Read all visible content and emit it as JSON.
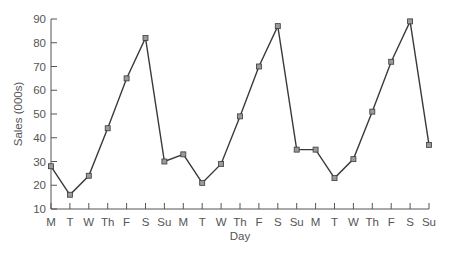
{
  "chart_data": {
    "type": "line",
    "title": "",
    "xlabel": "Day",
    "ylabel": "Sales (000s)",
    "ylim": [
      10,
      90
    ],
    "yticks": [
      10,
      20,
      30,
      40,
      50,
      60,
      70,
      80,
      90
    ],
    "grid": false,
    "legend": null,
    "categories": [
      "M",
      "T",
      "W",
      "Th",
      "F",
      "S",
      "Su",
      "M",
      "T",
      "W",
      "Th",
      "F",
      "S",
      "Su",
      "M",
      "T",
      "W",
      "Th",
      "F",
      "S",
      "Su"
    ],
    "series": [
      {
        "name": "Sales",
        "marker": "square",
        "values": [
          28,
          16,
          24,
          44,
          65,
          82,
          30,
          33,
          21,
          29,
          49,
          70,
          87,
          35,
          35,
          23,
          31,
          51,
          72,
          89,
          37
        ]
      }
    ]
  },
  "style": {
    "line_color": "#3a3a3a",
    "marker_fill": "#9a9a9a",
    "axis_color": "#555555"
  }
}
